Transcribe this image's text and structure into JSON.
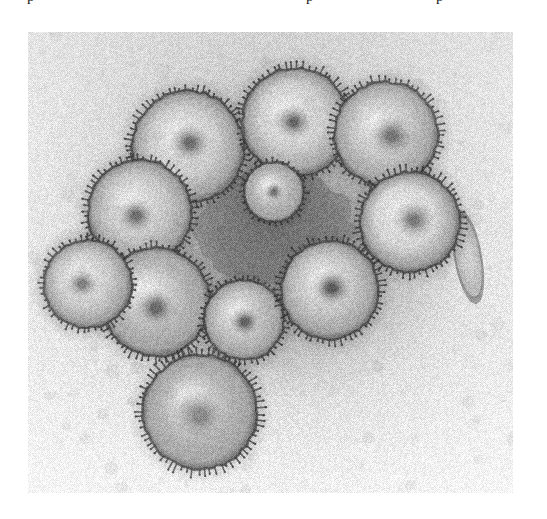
{
  "page": {
    "background_color": "#ffffff",
    "width": 547,
    "height": 519
  },
  "clipped_text_line": {
    "note": "bottom descenders of a cut-off line of body text above the figure",
    "fragments": [
      {
        "glyph": "p",
        "x": 27
      },
      {
        "glyph": "p",
        "x": 306
      },
      {
        "glyph": "p",
        "x": 436
      }
    ]
  },
  "figure": {
    "kind": "transmission-electron-micrograph",
    "caption": "",
    "frame": {
      "x": 28,
      "y": 32,
      "width": 485,
      "height": 461
    },
    "tone": {
      "background_color": "#ededed",
      "mid_color": "#9a9a9a",
      "shadow_color": "#3c3c3c",
      "highlight_color": "#e8e8e8"
    },
    "grain": {
      "type": "halftone-scan-noise",
      "amount": 0.16,
      "cell": 2
    },
    "features": {
      "note": "coordinates are relative to the micrograph frame (485x461)",
      "virions": [
        {
          "name": "virion-top-left",
          "cx": 160,
          "cy": 115,
          "r": 56,
          "core_r": 22,
          "core_dx": 2,
          "core_dy": -4,
          "spikes": 62,
          "spike_len": 7,
          "body": "#c9c9c9",
          "core": "#6e6e6e"
        },
        {
          "name": "virion-top-center",
          "cx": 268,
          "cy": 90,
          "r": 54,
          "core_r": 20,
          "core_dx": -2,
          "core_dy": 0,
          "spikes": 60,
          "spike_len": 7,
          "body": "#cccccc",
          "core": "#6a6a6a"
        },
        {
          "name": "virion-top-right",
          "cx": 358,
          "cy": 102,
          "r": 52,
          "core_r": 24,
          "core_dx": 6,
          "core_dy": 2,
          "spikes": 58,
          "spike_len": 7,
          "body": "#c0c0c0",
          "core": "#747474"
        },
        {
          "name": "virion-left-upper",
          "cx": 112,
          "cy": 180,
          "r": 52,
          "core_r": 20,
          "core_dx": -4,
          "core_dy": 4,
          "spikes": 58,
          "spike_len": 7,
          "body": "#c4c4c4",
          "core": "#6d6d6d"
        },
        {
          "name": "virion-right-upper",
          "cx": 382,
          "cy": 190,
          "r": 50,
          "core_r": 22,
          "core_dx": 4,
          "core_dy": -2,
          "spikes": 56,
          "spike_len": 7,
          "body": "#d2d2d2",
          "core": "#7a7a7a"
        },
        {
          "name": "virion-left-lower",
          "cx": 128,
          "cy": 270,
          "r": 54,
          "core_r": 22,
          "core_dx": 0,
          "core_dy": 6,
          "spikes": 60,
          "spike_len": 7,
          "body": "#b6b6b6",
          "core": "#666666"
        },
        {
          "name": "virion-center-lower",
          "cx": 216,
          "cy": 288,
          "r": 40,
          "core_r": 17,
          "core_dx": 1,
          "core_dy": 2,
          "spikes": 46,
          "spike_len": 6,
          "body": "#bdbdbd",
          "core": "#5f5f5f"
        },
        {
          "name": "virion-right-lower",
          "cx": 302,
          "cy": 258,
          "r": 49,
          "core_r": 21,
          "core_dx": 2,
          "core_dy": -2,
          "spikes": 56,
          "spike_len": 7,
          "body": "#c2c2c2",
          "core": "#5c5c5c"
        },
        {
          "name": "virion-bottom",
          "cx": 172,
          "cy": 380,
          "r": 57,
          "core_r": 30,
          "core_dx": 0,
          "core_dy": 4,
          "spikes": 64,
          "spike_len": 8,
          "body": "#b2b2b2",
          "core": "#8a8a8a"
        },
        {
          "name": "virion-left-edge",
          "cx": 60,
          "cy": 252,
          "r": 44,
          "core_r": 17,
          "core_dx": -6,
          "core_dy": 0,
          "spikes": 50,
          "spike_len": 6,
          "body": "#c8c8c8",
          "core": "#7c7c7c"
        },
        {
          "name": "virion-upper-edge-small",
          "cx": 246,
          "cy": 160,
          "r": 30,
          "core_r": 11,
          "core_dx": 0,
          "core_dy": 0,
          "spikes": 34,
          "spike_len": 5,
          "body": "#b4b4b4",
          "core": "#6b6b6b"
        }
      ],
      "dense_mass": {
        "name": "central-dense-aggregate",
        "cx": 248,
        "cy": 196,
        "rx": 80,
        "ry": 58,
        "fill": "#7c7c7c"
      },
      "filament": {
        "name": "filamentous-particle",
        "cx": 440,
        "cy": 225,
        "rx": 13,
        "ry": 44,
        "rotate": -10,
        "fill": "#b8b8b8"
      }
    }
  }
}
